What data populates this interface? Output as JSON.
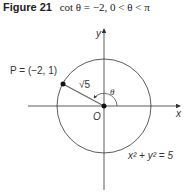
{
  "figure": {
    "number_label": "Figure 21",
    "caption": "cot θ = −2, 0 < θ < π"
  },
  "diagram": {
    "axes": {
      "x_label": "x",
      "y_label": "y",
      "origin_label": "O"
    },
    "point": {
      "label": "P = (−2, 1)",
      "x": -2,
      "y": 1
    },
    "radius_label": "√5",
    "angle_label": "θ",
    "circle_equation": "x² + y² = 5",
    "colors": {
      "stroke": "#333333",
      "radius_line": "#555555"
    }
  }
}
